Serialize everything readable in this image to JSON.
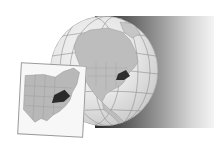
{
  "illustration": {
    "subject": "Locator map of Virginia",
    "globe": {
      "region_shown": "North America",
      "highlighted_state": "Virginia",
      "land_color": "#bdbdbd",
      "highlight_color": "#2e2e2e",
      "ocean_color": "#ececec",
      "graticule": true
    },
    "inset_map": {
      "region_shown": "Eastern United States",
      "highlighted_state": "Virginia",
      "land_color": "#b8b8b8",
      "highlight_color": "#2a2a2a",
      "background_color": "#f7f7f7"
    },
    "shadow": {
      "direction": "right",
      "gradient_from": "#2b2b2b",
      "gradient_to": "#f4f4f4"
    }
  }
}
